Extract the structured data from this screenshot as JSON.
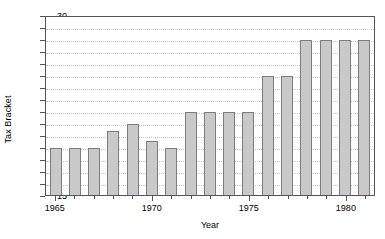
{
  "chart_data": {
    "type": "bar",
    "title": "",
    "xlabel": "Year",
    "ylabel": "Tax Bracket",
    "ylim": [
      15,
      30
    ],
    "xlim": [
      1964.3,
      1981.7
    ],
    "grid": true,
    "legend": false,
    "bar_fill_color": "#c9c9c9",
    "bar_edge_color": "#7d7d7d",
    "axis_color": "#555555",
    "gridline_color": "#c4c4c4",
    "ytick_labels": [
      "15",
      "16",
      "17",
      "18",
      "19",
      "20",
      "21",
      "22",
      "23",
      "24",
      "25",
      "26",
      "27",
      "28",
      "29",
      "30"
    ],
    "ytick_values": [
      15,
      16,
      17,
      18,
      19,
      20,
      21,
      22,
      23,
      24,
      25,
      26,
      27,
      28,
      29,
      30
    ],
    "xtick_labels": [
      "1965",
      "1970",
      "1975",
      "1980"
    ],
    "xtick_values": [
      1965,
      1970,
      1975,
      1980
    ],
    "categories": [
      1965,
      1966,
      1967,
      1968,
      1969,
      1970,
      1971,
      1972,
      1973,
      1974,
      1975,
      1976,
      1977,
      1978,
      1979,
      1980,
      1981
    ],
    "values": [
      19,
      19,
      19,
      20.4,
      21,
      19.6,
      19,
      22,
      22,
      22,
      22,
      25,
      25,
      28,
      28,
      28,
      28
    ]
  }
}
